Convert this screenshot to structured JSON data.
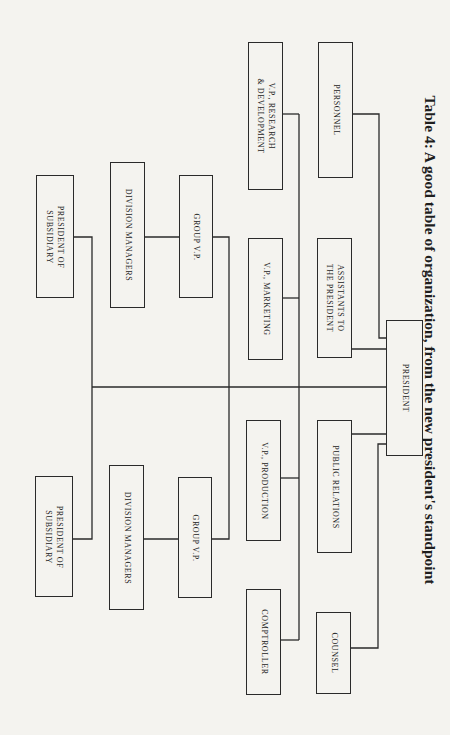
{
  "title": "Table 4: A good table of organization, from the new president's standpoint",
  "chart": {
    "president": "PRESIDENT",
    "staff_left": [
      "PERSONNEL",
      "ASSISTANTS TO\nTHE PRESIDENT"
    ],
    "staff_right": [
      "PUBLIC RELATIONS",
      "COUNSEL"
    ],
    "vps_left": [
      "V.P., RESEARCH\n& DEVELOPMENT",
      "V.P., MARKETING"
    ],
    "vps_right": [
      "V.P., PRODUCTION",
      "COMPTROLLER"
    ],
    "group_left": {
      "group_vp": "GROUP V.P.",
      "division_managers": "DIVISION MANAGERS",
      "subsidiary_president": "PRESIDENT OF\nSUBSIDIARY"
    },
    "group_right": {
      "group_vp": "GROUP V.P.",
      "division_managers": "DIVISION MANAGERS",
      "subsidiary_president": "PRESIDENT OF\nSUBSIDIARY"
    }
  }
}
